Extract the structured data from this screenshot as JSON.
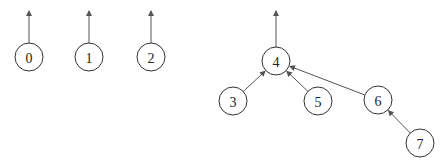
{
  "diagram": {
    "type": "disjoint-set-forest",
    "nodes": [
      {
        "id": "0",
        "label": "0",
        "x": 29,
        "y": 57
      },
      {
        "id": "1",
        "label": "1",
        "x": 89,
        "y": 57
      },
      {
        "id": "2",
        "label": "2",
        "x": 151,
        "y": 57
      },
      {
        "id": "3",
        "label": "3",
        "x": 233,
        "y": 101
      },
      {
        "id": "4",
        "label": "4",
        "x": 276,
        "y": 61
      },
      {
        "id": "5",
        "label": "5",
        "x": 318,
        "y": 101
      },
      {
        "id": "6",
        "label": "6",
        "x": 378,
        "y": 100
      },
      {
        "id": "7",
        "label": "7",
        "x": 420,
        "y": 143
      }
    ],
    "edges": [
      {
        "from": "3",
        "to": "4"
      },
      {
        "from": "5",
        "to": "4"
      },
      {
        "from": "6",
        "to": "4"
      },
      {
        "from": "7",
        "to": "6"
      }
    ],
    "root_arrows": [
      "0",
      "1",
      "2",
      "4"
    ],
    "node_radius": 14,
    "colors": {
      "stroke": "#333333",
      "edge": "#555555",
      "background": "#ffffff"
    }
  }
}
